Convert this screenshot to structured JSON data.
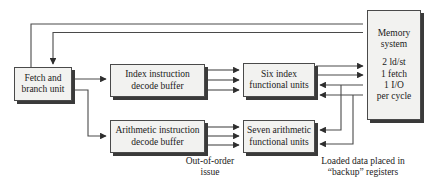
{
  "diagram": {
    "stroke_color": "#4a4a4a",
    "shadow_color": "#3a3a3a",
    "box_fill": "#f2f2f0",
    "text_color": "#1a1a1a",
    "background": "#ffffff"
  },
  "boxes": {
    "fetch": {
      "name": "fetch-and-branch-unit",
      "line1": "Fetch and",
      "line2": "branch unit"
    },
    "index_decode": {
      "name": "index-instruction-decode-buffer",
      "line1": "Index instruction",
      "line2": "decode buffer"
    },
    "index_units": {
      "name": "six-index-functional-units",
      "line1": "Six index",
      "line2": "functional units"
    },
    "arith_decode": {
      "name": "arithmetic-instruction-decode-buffer",
      "line1": "Arithmetic instruction",
      "line2": "decode buffer"
    },
    "arith_units": {
      "name": "seven-arithmetic-functional-units",
      "line1": "Seven arithmetic",
      "line2": "functional units"
    },
    "memory": {
      "name": "memory-system",
      "line1": "Memory",
      "line2": "system",
      "rate1": "2 ld/st",
      "rate2": "1 fetch",
      "rate3": "1 I/O",
      "rate4": "per cycle"
    }
  },
  "captions": {
    "out_of_order": {
      "line1": "Out-of-order",
      "line2": "issue"
    },
    "backup_registers": {
      "line1": "Loaded data placed in",
      "line2": "“backup” registers"
    }
  }
}
